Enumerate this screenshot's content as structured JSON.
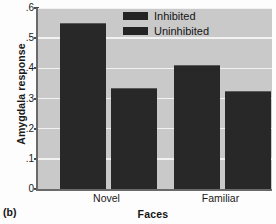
{
  "chart_data": {
    "type": "bar",
    "title": "",
    "panel_label": "(b)",
    "xlabel": "Faces",
    "ylabel": "Amygdala response",
    "categories": [
      "Novel",
      "Familiar"
    ],
    "series": [
      {
        "name": "Inhibited",
        "values": [
          0.55,
          0.41
        ],
        "color": "#282828"
      },
      {
        "name": "Uninhibited",
        "values": [
          0.335,
          0.325
        ],
        "color": "#282828"
      }
    ],
    "ylim": [
      0,
      0.6
    ],
    "yticks": [
      0,
      0.1,
      0.2,
      0.3,
      0.4,
      0.5,
      0.6
    ],
    "ytick_labels": [
      "0",
      ".1",
      ".2",
      ".3",
      ".4",
      ".5",
      ".6"
    ],
    "grid": true,
    "grid_color": "#f2f2f2",
    "plot_background": "#c9c9c9",
    "legend_position": "top-right",
    "legend": [
      {
        "label": "Inhibited",
        "swatch": "#242424"
      },
      {
        "label": "Uninhibited",
        "swatch": "#242424"
      }
    ]
  }
}
